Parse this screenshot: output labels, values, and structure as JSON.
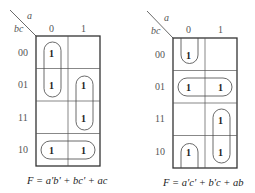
{
  "maps": [
    {
      "id": "left",
      "var_col": "a",
      "var_row": "bc",
      "col_labels": [
        "0",
        "1"
      ],
      "row_labels": [
        "00",
        "01",
        "11",
        "10"
      ],
      "cells": [
        [
          "1",
          ""
        ],
        [
          "1",
          "1"
        ],
        [
          "",
          "1"
        ],
        [
          "1",
          "1"
        ]
      ],
      "groupings": [
        {
          "term": "a'b'",
          "cells": [
            [
              0,
              0
            ],
            [
              1,
              0
            ]
          ],
          "shape": "vertical-loop"
        },
        {
          "term": "ac",
          "cells": [
            [
              1,
              1
            ],
            [
              2,
              1
            ]
          ],
          "shape": "vertical-loop"
        },
        {
          "term": "bc'",
          "cells": [
            [
              3,
              0
            ],
            [
              3,
              1
            ]
          ],
          "shape": "horizontal-loop"
        }
      ],
      "equation": "F = a'b' + bc' + ac"
    },
    {
      "id": "right",
      "var_col": "a",
      "var_row": "bc",
      "col_labels": [
        "0",
        "1"
      ],
      "row_labels": [
        "00",
        "01",
        "11",
        "10"
      ],
      "cells": [
        [
          "1",
          ""
        ],
        [
          "1",
          "1"
        ],
        [
          "",
          "1"
        ],
        [
          "1",
          "1"
        ]
      ],
      "groupings": [
        {
          "term": "a'c'",
          "cells": [
            [
              0,
              0
            ],
            [
              3,
              0
            ]
          ],
          "shape": "wraparound"
        },
        {
          "term": "b'c",
          "cells": [
            [
              1,
              0
            ],
            [
              1,
              1
            ]
          ],
          "shape": "horizontal-loop"
        },
        {
          "term": "ab",
          "cells": [
            [
              2,
              1
            ],
            [
              3,
              1
            ]
          ],
          "shape": "vertical-loop"
        }
      ],
      "equation": "F = a'c' + b'c + ab"
    }
  ]
}
